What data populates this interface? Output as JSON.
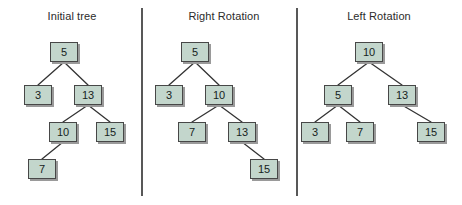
{
  "figure": {
    "width": 462,
    "height": 205,
    "background": "#ffffff",
    "node_fill": "#c3d6cc",
    "node_border": "#474747",
    "node_shadow": "#9a9a9a",
    "edge_color": "#333333",
    "divider_color": "#585858",
    "title_color": "#2b2b2b"
  },
  "dividers": [
    {
      "name": "divider-1",
      "x": 141,
      "y": 8,
      "height": 188
    },
    {
      "name": "divider-2",
      "x": 296,
      "y": 8,
      "height": 188
    }
  ],
  "panels": [
    {
      "id": "initial-tree",
      "title": "Initial tree",
      "title_x": 27,
      "title_y": 10,
      "title_width": 90
    },
    {
      "id": "right-rotation",
      "title": "Right Rotation",
      "title_x": 176,
      "title_y": 10,
      "title_width": 96
    },
    {
      "id": "left-rotation",
      "title": "Left Rotation",
      "title_x": 333,
      "title_y": 10,
      "title_width": 92
    }
  ],
  "chart_data": {
    "type": "diagram",
    "subtitle": "",
    "panels": [
      {
        "name": "Initial tree",
        "root": 5,
        "nodes": [
          {
            "label": "5",
            "x": 50,
            "y": 42,
            "w": 28,
            "h": 20
          },
          {
            "label": "3",
            "x": 24,
            "y": 85,
            "w": 28,
            "h": 20
          },
          {
            "label": "13",
            "x": 74,
            "y": 85,
            "w": 28,
            "h": 20
          },
          {
            "label": "10",
            "x": 49,
            "y": 122,
            "w": 28,
            "h": 20
          },
          {
            "label": "15",
            "x": 96,
            "y": 122,
            "w": 28,
            "h": 20
          },
          {
            "label": "7",
            "x": 28,
            "y": 159,
            "w": 28,
            "h": 20
          }
        ],
        "edges": [
          {
            "from": "5",
            "to": "3",
            "x1": 64,
            "y1": 62,
            "x2": 38,
            "y2": 85
          },
          {
            "from": "5",
            "to": "13",
            "x1": 64,
            "y1": 62,
            "x2": 88,
            "y2": 85
          },
          {
            "from": "13",
            "to": "10",
            "x1": 88,
            "y1": 105,
            "x2": 63,
            "y2": 122
          },
          {
            "from": "13",
            "to": "15",
            "x1": 88,
            "y1": 105,
            "x2": 110,
            "y2": 122
          },
          {
            "from": "10",
            "to": "7",
            "x1": 63,
            "y1": 142,
            "x2": 42,
            "y2": 159
          }
        ],
        "structure": "5 -> (3, 13); 13 -> (10, 15); 10 -> (7, null)"
      },
      {
        "name": "Right Rotation",
        "root": 5,
        "nodes": [
          {
            "label": "5",
            "x": 181,
            "y": 42,
            "w": 28,
            "h": 20
          },
          {
            "label": "3",
            "x": 155,
            "y": 85,
            "w": 28,
            "h": 20
          },
          {
            "label": "10",
            "x": 205,
            "y": 85,
            "w": 28,
            "h": 20
          },
          {
            "label": "7",
            "x": 178,
            "y": 122,
            "w": 28,
            "h": 20
          },
          {
            "label": "13",
            "x": 228,
            "y": 122,
            "w": 28,
            "h": 20
          },
          {
            "label": "15",
            "x": 250,
            "y": 159,
            "w": 28,
            "h": 20
          }
        ],
        "edges": [
          {
            "from": "5",
            "to": "3",
            "x1": 195,
            "y1": 62,
            "x2": 169,
            "y2": 85
          },
          {
            "from": "5",
            "to": "10",
            "x1": 195,
            "y1": 62,
            "x2": 219,
            "y2": 85
          },
          {
            "from": "10",
            "to": "7",
            "x1": 219,
            "y1": 105,
            "x2": 192,
            "y2": 122
          },
          {
            "from": "10",
            "to": "13",
            "x1": 219,
            "y1": 105,
            "x2": 242,
            "y2": 122
          },
          {
            "from": "13",
            "to": "15",
            "x1": 242,
            "y1": 142,
            "x2": 264,
            "y2": 159
          }
        ],
        "structure": "5 -> (3, 10); 10 -> (7, 13); 13 -> (null, 15)"
      },
      {
        "name": "Left Rotation",
        "root": 10,
        "nodes": [
          {
            "label": "10",
            "x": 355,
            "y": 42,
            "w": 28,
            "h": 20
          },
          {
            "label": "5",
            "x": 324,
            "y": 85,
            "w": 28,
            "h": 20
          },
          {
            "label": "13",
            "x": 388,
            "y": 85,
            "w": 28,
            "h": 20
          },
          {
            "label": "3",
            "x": 301,
            "y": 122,
            "w": 28,
            "h": 20
          },
          {
            "label": "7",
            "x": 346,
            "y": 122,
            "w": 28,
            "h": 20
          },
          {
            "label": "15",
            "x": 417,
            "y": 122,
            "w": 28,
            "h": 20
          }
        ],
        "edges": [
          {
            "from": "10",
            "to": "5",
            "x1": 369,
            "y1": 62,
            "x2": 338,
            "y2": 85
          },
          {
            "from": "10",
            "to": "13",
            "x1": 369,
            "y1": 62,
            "x2": 402,
            "y2": 85
          },
          {
            "from": "5",
            "to": "3",
            "x1": 338,
            "y1": 105,
            "x2": 315,
            "y2": 122
          },
          {
            "from": "5",
            "to": "7",
            "x1": 338,
            "y1": 105,
            "x2": 360,
            "y2": 122
          },
          {
            "from": "13",
            "to": "15",
            "x1": 402,
            "y1": 105,
            "x2": 431,
            "y2": 122
          }
        ],
        "structure": "10 -> (5, 13); 5 -> (3, 7); 13 -> (null, 15)"
      }
    ]
  }
}
